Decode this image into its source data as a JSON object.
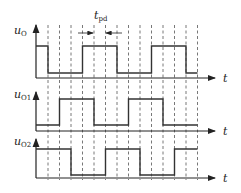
{
  "diagram": {
    "type": "timing-diagram",
    "signals": [
      {
        "name": "u_O",
        "label_main": "u",
        "label_sub": "O",
        "states": [
          1,
          0,
          0,
          0,
          1,
          1,
          1,
          0,
          0,
          0,
          1,
          1,
          1,
          0
        ],
        "axis_label": "t"
      },
      {
        "name": "u_O1",
        "label_main": "u",
        "label_sub": "O1",
        "states": [
          0,
          0,
          1,
          1,
          1,
          0,
          0,
          0,
          1,
          1,
          1,
          0,
          0,
          0
        ],
        "axis_label": "t"
      },
      {
        "name": "u_O2",
        "label_main": "u",
        "label_sub": "O2",
        "states": [
          1,
          1,
          1,
          0,
          0,
          0,
          1,
          1,
          1,
          0,
          0,
          0,
          1,
          1
        ],
        "axis_label": "t"
      }
    ],
    "annotation": {
      "label_main": "t",
      "label_sub": "pd"
    },
    "colors": {
      "line": "#333333",
      "dashed": "#555555"
    }
  }
}
